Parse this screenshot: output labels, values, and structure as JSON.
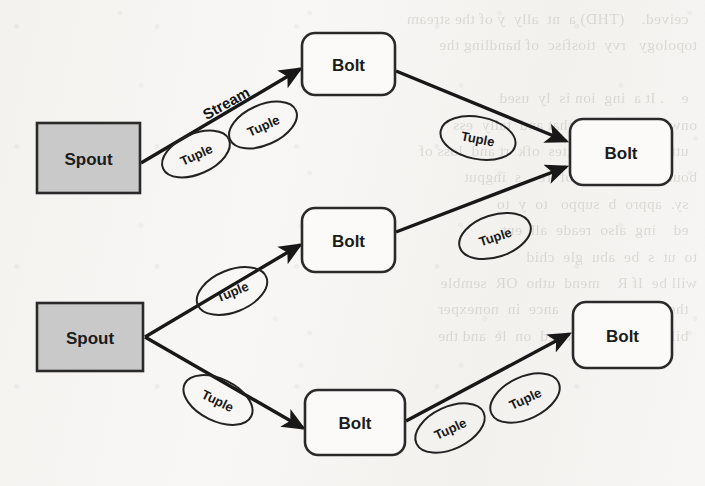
{
  "page": {
    "background_color": "#f6f5f3",
    "ink_color": "#181818",
    "width": 705,
    "height": 486
  },
  "diagram": {
    "type": "flow-diagram",
    "node_fill_spout": "#c9c9c9",
    "node_fill_bolt": "#fbfaf8",
    "node_stroke": "#2a2a2a",
    "nodes": [
      {
        "id": "spout-1",
        "label": "Spout",
        "kind": "spout",
        "shape": "rectangle",
        "x": 37,
        "y": 123,
        "w": 103,
        "h": 70
      },
      {
        "id": "spout-2",
        "label": "Spout",
        "kind": "spout",
        "shape": "rectangle",
        "x": 37,
        "y": 303,
        "w": 106,
        "h": 68
      },
      {
        "id": "bolt-1",
        "label": "Bolt",
        "kind": "bolt",
        "shape": "rounded-rectangle",
        "x": 302,
        "y": 33,
        "w": 93,
        "h": 62
      },
      {
        "id": "bolt-2",
        "label": "Bolt",
        "kind": "bolt",
        "shape": "rounded-rectangle",
        "x": 302,
        "y": 208,
        "w": 93,
        "h": 64
      },
      {
        "id": "bolt-3",
        "label": "Bolt",
        "kind": "bolt",
        "shape": "rounded-rectangle",
        "x": 305,
        "y": 390,
        "w": 100,
        "h": 65
      },
      {
        "id": "bolt-4",
        "label": "Bolt",
        "kind": "bolt",
        "shape": "rounded-rectangle",
        "x": 570,
        "y": 119,
        "w": 102,
        "h": 66
      },
      {
        "id": "bolt-5",
        "label": "Bolt",
        "kind": "bolt",
        "shape": "rounded-rectangle",
        "x": 573,
        "y": 302,
        "w": 99,
        "h": 66
      }
    ],
    "edges": [
      {
        "id": "edge-spout1-bolt1",
        "from": "spout-1",
        "to": "bolt-1",
        "x1": 141,
        "y1": 163,
        "x2": 300,
        "y2": 69
      },
      {
        "id": "edge-bolt1-bolt4",
        "from": "bolt-1",
        "to": "bolt-4",
        "x1": 396,
        "y1": 71,
        "x2": 566,
        "y2": 141
      },
      {
        "id": "edge-bolt2-bolt4",
        "from": "bolt-2",
        "to": "bolt-4",
        "x1": 396,
        "y1": 232,
        "x2": 566,
        "y2": 167
      },
      {
        "id": "edge-spout2-bolt2",
        "from": "spout-2",
        "to": "bolt-2",
        "x1": 145,
        "y1": 337,
        "x2": 300,
        "y2": 245
      },
      {
        "id": "edge-spout2-bolt3",
        "from": "spout-2",
        "to": "bolt-3",
        "x1": 145,
        "y1": 337,
        "x2": 303,
        "y2": 428
      },
      {
        "id": "edge-bolt3-bolt5",
        "from": "bolt-3",
        "to": "bolt-5",
        "x1": 406,
        "y1": 421,
        "x2": 569,
        "y2": 334
      }
    ],
    "stream_labels": [
      {
        "id": "stream-label-1",
        "text": "Stream",
        "cx": 226,
        "cy": 103,
        "rotation": -29
      }
    ],
    "tuple_labels": [
      {
        "id": "tuple-1",
        "text": "Tuple",
        "cx": 196,
        "cy": 154,
        "rx": 36,
        "ry": 20,
        "rotation": -24
      },
      {
        "id": "tuple-2",
        "text": "Tuple",
        "cx": 263,
        "cy": 125,
        "rx": 36,
        "ry": 20,
        "rotation": -24
      },
      {
        "id": "tuple-3",
        "text": "Tuple",
        "cx": 478,
        "cy": 138,
        "rx": 38,
        "ry": 21,
        "rotation": 11
      },
      {
        "id": "tuple-4",
        "text": "Tuple",
        "cx": 495,
        "cy": 236,
        "rx": 37,
        "ry": 21,
        "rotation": -18
      },
      {
        "id": "tuple-5",
        "text": "Tuple",
        "cx": 232,
        "cy": 291,
        "rx": 37,
        "ry": 21,
        "rotation": -22
      },
      {
        "id": "tuple-6",
        "text": "Tuple",
        "cx": 218,
        "cy": 400,
        "rx": 37,
        "ry": 21,
        "rotation": 26
      },
      {
        "id": "tuple-7",
        "text": "Tuple",
        "cx": 450,
        "cy": 428,
        "rx": 37,
        "ry": 21,
        "rotation": -25
      },
      {
        "id": "tuple-8",
        "text": "Tuple",
        "cx": 525,
        "cy": 398,
        "rx": 37,
        "ry": 21,
        "rotation": -25
      }
    ]
  },
  "bleed_through": {
    "left_column": "  ceived.    (THD) a  nt  ally  y of the stream\ntopology   rvy  tiosfisc  of handling the\n\n  e    . It a  ing  ion is  ly  used\nonward  ver  only  that and  tally  ess\n  uttles  ord  mmmittes  ofk  rt and  loss of\nboundary  red  he  of  re    s  ingput\n  sy.  appro  b  suppo   to  y  to\n  ed    ing  also  reade  all  ent\nto  ut  s  be  abu  gle  chid\nwill be  If R    mend  utho  OR  semble\n  there  tad  h  tern    ance  in  nonexper\n  bility  te  ns  ng  tuned  on  le  and the",
    "right_column": "\n\n\n\n\n\n\n\n\n\n\n"
  }
}
